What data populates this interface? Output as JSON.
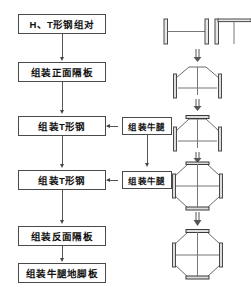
{
  "diagram": {
    "flow_boxes": [
      {
        "id": "box-1",
        "label": "H、T形钢组对"
      },
      {
        "id": "box-2",
        "label": "组装正面隔板"
      },
      {
        "id": "box-3",
        "label": "组装T形钢"
      },
      {
        "id": "box-4",
        "label": "组装T形钢"
      },
      {
        "id": "box-5",
        "label": "组装反面隔板"
      },
      {
        "id": "box-6",
        "label": "组装牛腿地脚板"
      }
    ],
    "side_boxes": [
      {
        "id": "side-1",
        "label": "组装牛腿"
      },
      {
        "id": "side-2",
        "label": "组装片牛腿"
      }
    ],
    "side_labels": {
      "first": "组装牛腿",
      "second": "组装牛腿"
    },
    "illustrations": [
      {
        "id": "ill-1",
        "name": "h-beam-and-t-beam-profile"
      },
      {
        "id": "ill-2",
        "name": "trapezoid-section-stage-1"
      },
      {
        "id": "ill-3",
        "name": "trapezoid-section-stage-2"
      },
      {
        "id": "ill-4",
        "name": "octagon-section-stage-1"
      },
      {
        "id": "ill-5",
        "name": "octagon-section-stage-2"
      }
    ],
    "colors": {
      "box_border": "#4a4a4a",
      "line": "#555555",
      "arrow": "#444444",
      "drawing_stroke": "#555555",
      "drawing_thick": "#3a3a3a",
      "text": "#111111",
      "background": "#ffffff"
    }
  }
}
